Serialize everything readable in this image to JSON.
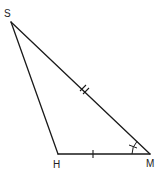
{
  "diagram": {
    "type": "triangle",
    "vertices": [
      {
        "id": "S",
        "label": "S",
        "x": 11,
        "y": 22,
        "label_x": 4,
        "label_y": 17
      },
      {
        "id": "H",
        "label": "H",
        "x": 58,
        "y": 154,
        "label_x": 53,
        "label_y": 168
      },
      {
        "id": "M",
        "label": "M",
        "x": 150,
        "y": 154,
        "label_x": 146,
        "label_y": 167
      }
    ],
    "edges": [
      {
        "from": "S",
        "to": "H",
        "marks": 0
      },
      {
        "from": "S",
        "to": "M",
        "marks": 2
      },
      {
        "from": "H",
        "to": "M",
        "marks": 1
      }
    ],
    "angle_marks": [
      {
        "vertex": "M",
        "arcs": 1,
        "ticks": 1
      }
    ],
    "stroke_color": "#1a1a1a",
    "background": "#ffffff"
  }
}
